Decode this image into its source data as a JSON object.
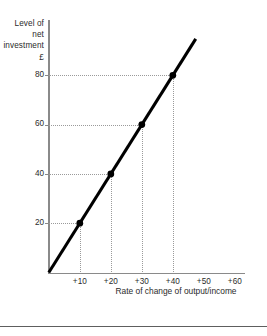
{
  "chart_data": {
    "type": "line",
    "title": "",
    "xlabel": "Rate of change of output/income",
    "ylabel": "Level of net investment £",
    "ylabel_lines": [
      "Level of",
      "net",
      "investment",
      "£"
    ],
    "x": [
      10,
      20,
      30,
      40
    ],
    "values": [
      20,
      40,
      60,
      80
    ],
    "point_labels": [
      "+10",
      "+20",
      "+30",
      "+40"
    ],
    "series": [
      {
        "name": "Net investment",
        "values": [
          20,
          40,
          60,
          80
        ]
      }
    ],
    "xticks": [
      "+10",
      "+20",
      "+30",
      "+40",
      "+50",
      "+60"
    ],
    "xtick_values": [
      10,
      20,
      30,
      40,
      50,
      60
    ],
    "yticks": [
      "20",
      "40",
      "60",
      "80"
    ],
    "ytick_values": [
      20,
      40,
      60,
      80
    ],
    "xlim": [
      0,
      65
    ],
    "ylim": [
      0,
      95
    ],
    "grid": "dotted-guides-to-points",
    "legend": "none",
    "line_color": "#000000",
    "grid_color": "#9a9a9a",
    "axis_color": "#8a8a8a",
    "marker": "filled-circle",
    "slope": 2,
    "intercept": 0
  },
  "axis": {
    "y_ticks": [
      {
        "label": "80",
        "value": 80
      },
      {
        "label": "60",
        "value": 60
      },
      {
        "label": "40",
        "value": 40
      },
      {
        "label": "20",
        "value": 20
      }
    ],
    "x_ticks": [
      {
        "label": "+10",
        "value": 10
      },
      {
        "label": "+20",
        "value": 20
      },
      {
        "label": "+30",
        "value": 30
      },
      {
        "label": "+40",
        "value": 40
      },
      {
        "label": "+50",
        "value": 50
      },
      {
        "label": "+60",
        "value": 60
      }
    ]
  },
  "labels": {
    "y_line_1": "Level of",
    "y_line_2": "net",
    "y_line_3": "investment",
    "y_line_4": "£",
    "x_caption": "Rate of change of output/income"
  }
}
